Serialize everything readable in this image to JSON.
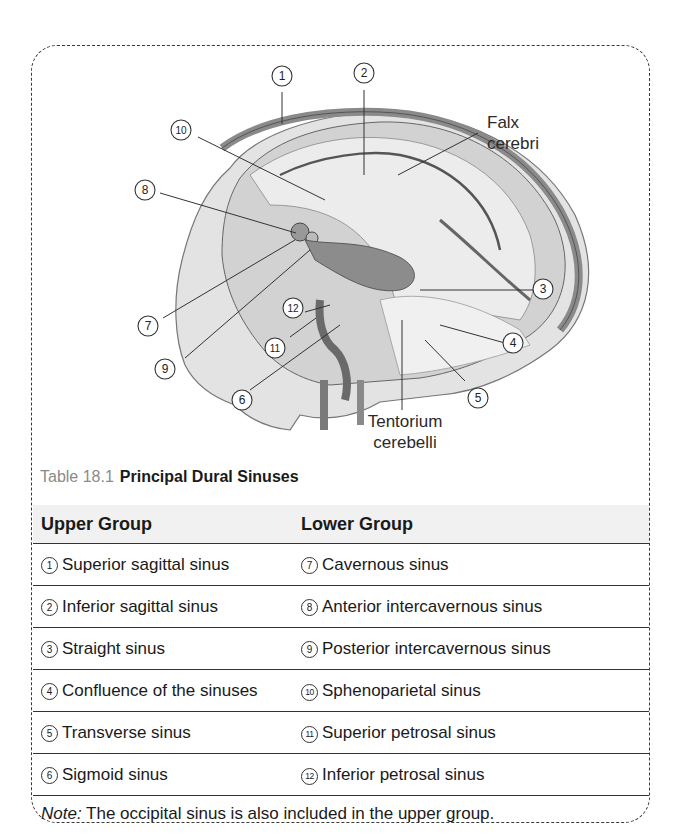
{
  "figure": {
    "labels": {
      "falx_cerebri": [
        "Falx",
        "cerebri"
      ],
      "tentorium_cerebelli": [
        "Tentorium",
        "cerebelli"
      ]
    },
    "callouts": [
      "1",
      "2",
      "3",
      "4",
      "5",
      "6",
      "7",
      "8",
      "9",
      "10",
      "11",
      "12"
    ]
  },
  "caption": {
    "number": "Table 18.1",
    "title": "Principal Dural Sinuses"
  },
  "table": {
    "headers": [
      "Upper Group",
      "Lower Group"
    ],
    "rows": [
      {
        "upper_num": "1",
        "upper": "Superior sagittal sinus",
        "lower_num": "7",
        "lower": "Cavernous sinus"
      },
      {
        "upper_num": "2",
        "upper": "Inferior sagittal sinus",
        "lower_num": "8",
        "lower": "Anterior intercavernous sinus"
      },
      {
        "upper_num": "3",
        "upper": "Straight sinus",
        "lower_num": "9",
        "lower": "Posterior intercavernous sinus"
      },
      {
        "upper_num": "4",
        "upper": "Confluence of the sinuses",
        "lower_num": "10",
        "lower": "Sphenoparietal sinus"
      },
      {
        "upper_num": "5",
        "upper": "Transverse sinus",
        "lower_num": "11",
        "lower": "Superior petrosal sinus"
      },
      {
        "upper_num": "6",
        "upper": "Sigmoid sinus",
        "lower_num": "12",
        "lower": "Inferior petrosal sinus"
      }
    ]
  },
  "note": {
    "label": "Note:",
    "text": " The occipital sinus is also included in the upper group."
  }
}
